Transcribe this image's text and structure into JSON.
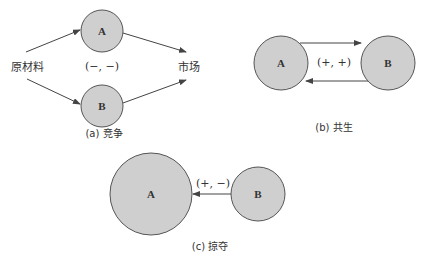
{
  "panels": {
    "a": {
      "caption": "(a) 竞争",
      "source_label": "原材料",
      "target_label": "市场",
      "interaction": "(−, −)",
      "nodes": {
        "A": "A",
        "B": "B"
      }
    },
    "b": {
      "caption": "(b) 共生",
      "interaction": "(+, +)",
      "nodes": {
        "A": "A",
        "B": "B"
      }
    },
    "c": {
      "caption": "(c) 掠夺",
      "interaction": "(+, −)",
      "nodes": {
        "A": "A",
        "B": "B"
      }
    }
  },
  "colors": {
    "node_fill": "#cfcfcf",
    "node_stroke": "#555555",
    "line": "#444444"
  }
}
